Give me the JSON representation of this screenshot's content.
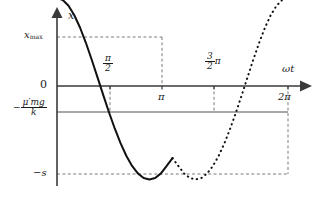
{
  "figure": {
    "axes": {
      "y_label": "x",
      "x_label": "ωt"
    },
    "y_ticks": [
      {
        "name": "x-max",
        "label_base": "x",
        "label_sub": "max",
        "value": "x_max"
      },
      {
        "name": "zero",
        "label": "0",
        "value": "0"
      },
      {
        "name": "minus-mu-mg-over-k",
        "sign": "−",
        "num": "μ′mg",
        "den": "k",
        "value": "-mu'mg/k"
      },
      {
        "name": "minus-s",
        "label": "−s",
        "value": "-s"
      }
    ],
    "x_ticks": [
      {
        "name": "half-pi",
        "num": "π",
        "den": "2",
        "suffix": "",
        "value": "pi/2"
      },
      {
        "name": "pi",
        "label": "π",
        "value": "pi"
      },
      {
        "name": "three-halves-pi",
        "num": "3",
        "den": "2",
        "suffix": "π",
        "value": "3pi/2"
      },
      {
        "name": "two-pi",
        "label": "2π",
        "value": "2pi"
      }
    ],
    "colors": {
      "axis": "#3a3a3a",
      "curve": "#111111",
      "reference_line": "#8a8a8a",
      "guide_line": "#7a7a7a",
      "background": "#ffffff"
    }
  },
  "chart_data": {
    "type": "line",
    "title": "",
    "xlabel": "ωt",
    "ylabel": "x",
    "xlim": [
      0,
      6.9115
    ],
    "ylim": [
      -1.0,
      1.0
    ],
    "xtick_values": [
      1.5708,
      3.1416,
      4.7124,
      6.2832
    ],
    "xtick_labels": [
      "π/2",
      "π",
      "3π/2",
      "2π"
    ],
    "ytick_values": [
      0.82,
      0.0,
      -0.34,
      -1.0
    ],
    "ytick_labels": [
      "x_max",
      "0",
      "-μ′mg/k",
      "-s"
    ],
    "grid": false,
    "legend": false,
    "reference_lines": [
      {
        "name": "zero-axis",
        "orientation": "horizontal",
        "y": 0.0,
        "style": "solid"
      },
      {
        "name": "friction-level",
        "orientation": "horizontal",
        "y": -0.34,
        "style": "solid",
        "color": "#8a8a8a"
      }
    ],
    "annotations": [
      {
        "name": "peak-guide-horizontal",
        "from": [
          0,
          0.82
        ],
        "to": [
          3.1416,
          0.82
        ],
        "style": "dashed"
      },
      {
        "name": "peak-guide-vertical",
        "from": [
          3.1416,
          0.82
        ],
        "to": [
          3.1416,
          0.0
        ],
        "style": "dashed"
      },
      {
        "name": "half-pi-guide",
        "from": [
          1.5708,
          0.0
        ],
        "to": [
          1.5708,
          -0.34
        ],
        "style": "dashed"
      },
      {
        "name": "three-halves-pi-guide",
        "from": [
          4.7124,
          0.0
        ],
        "to": [
          4.7124,
          -0.34
        ],
        "style": "dashed"
      },
      {
        "name": "two-pi-guide",
        "from": [
          6.2832,
          0.0
        ],
        "to": [
          6.2832,
          -1.0
        ],
        "style": "dashed"
      },
      {
        "name": "minus-s-guide",
        "from": [
          0,
          -1.0
        ],
        "to": [
          6.2832,
          -1.0
        ],
        "style": "dashed"
      }
    ],
    "series": [
      {
        "name": "solid-branch",
        "style": "solid",
        "description": "x = x_max_amp*(1 - cos(wt)) - s on 0..pi, motion under kinetic friction",
        "x": [
          0.0,
          0.1571,
          0.3142,
          0.4712,
          0.6283,
          0.7854,
          0.9425,
          1.0996,
          1.2566,
          1.4137,
          1.5708,
          1.7279,
          1.885,
          2.042,
          2.1991,
          2.3562,
          2.5133,
          2.6704,
          2.8274,
          2.9845,
          3.1416
        ],
        "y": [
          -1.0,
          -0.9776,
          -0.9112,
          -0.8041,
          -0.6618,
          -0.4913,
          -0.3012,
          -0.1012,
          0.1012,
          0.2981,
          0.4828,
          0.6494,
          0.7929,
          0.9085,
          0.9933,
          1.0448,
          1.0617,
          1.0448,
          0.9933,
          0.9085,
          0.82
        ]
      },
      {
        "name": "dashed-branch",
        "style": "dashed",
        "description": "continuation of sinusoid from peak at pi down to -s at 2pi",
        "x": [
          3.1416,
          3.2987,
          3.4558,
          3.6128,
          3.7699,
          3.927,
          4.0841,
          4.2412,
          4.3982,
          4.5553,
          4.7124,
          4.8695,
          5.0265,
          5.1836,
          5.3407,
          5.4978,
          5.6549,
          5.8119,
          5.969,
          6.1261,
          6.2832
        ],
        "y": [
          0.82,
          0.9085,
          0.9933,
          1.0448,
          1.0617,
          1.0448,
          0.9933,
          0.9085,
          0.7929,
          0.6494,
          0.4828,
          0.2981,
          0.1012,
          -0.1012,
          -0.3012,
          -0.4913,
          -0.6618,
          -0.8041,
          -0.9112,
          -0.9776,
          -1.0
        ]
      }
    ]
  }
}
